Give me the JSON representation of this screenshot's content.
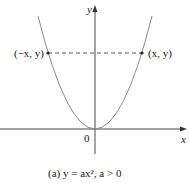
{
  "diagram": {
    "axes": {
      "x_label": "x",
      "y_label": "y",
      "origin_label": "0"
    },
    "points": {
      "left": "(−x, y)",
      "right": "(x, y)"
    },
    "curve": "parabola opening upward, vertex at origin",
    "caption": "(a)  y = ax²,  a > 0"
  },
  "colors": {
    "curve": "#8a8a8a",
    "axis": "#333333",
    "text": "#222222"
  }
}
